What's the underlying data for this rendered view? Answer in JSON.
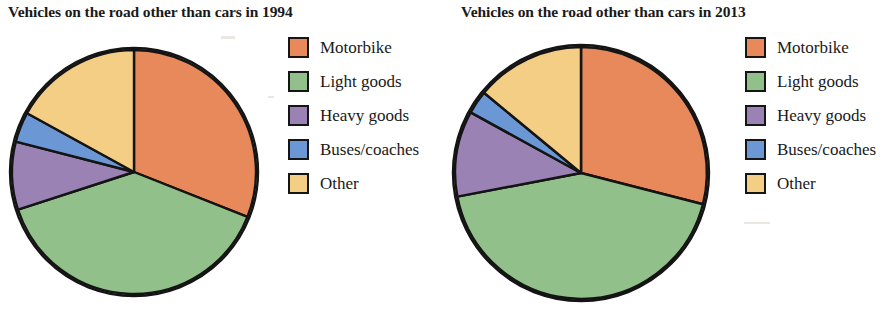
{
  "figure": {
    "background": "#ffffff",
    "panels": [
      {
        "title": "Vehicles on the road other than cars in 1994",
        "legend_title": "",
        "legend": [
          {
            "label": "Motorbike",
            "color": "#E8895C",
            "icon": "legend-swatch-motorbike"
          },
          {
            "label": "Light goods",
            "color": "#92C08A",
            "icon": "legend-swatch-light-goods"
          },
          {
            "label": "Heavy goods",
            "color": "#9B82B4",
            "icon": "legend-swatch-heavy-goods"
          },
          {
            "label": "Buses/coaches",
            "color": "#6B97D4",
            "icon": "legend-swatch-buses-coaches"
          },
          {
            "label": "Other",
            "color": "#F5CE85",
            "icon": "legend-swatch-other"
          }
        ]
      },
      {
        "title": "Vehicles on the road other than cars in 2013",
        "legend_title": "",
        "legend": [
          {
            "label": "Motorbike",
            "color": "#E8895C",
            "icon": "legend-swatch-motorbike"
          },
          {
            "label": "Light goods",
            "color": "#92C08A",
            "icon": "legend-swatch-light-goods"
          },
          {
            "label": "Heavy goods",
            "color": "#9B82B4",
            "icon": "legend-swatch-heavy-goods"
          },
          {
            "label": "Buses/coaches",
            "color": "#6B97D4",
            "icon": "legend-swatch-buses-coaches"
          },
          {
            "label": "Other",
            "color": "#F5CE85",
            "icon": "legend-swatch-other"
          }
        ]
      }
    ]
  },
  "chart_data": [
    {
      "type": "pie",
      "title": "Vehicles on the road other than cars in 1994",
      "xlabel": "",
      "ylabel": "",
      "legend_position": "right",
      "start_angle_deg": 0,
      "direction": "clockwise",
      "labels": [
        "Motorbike",
        "Light goods",
        "Heavy goods",
        "Buses/coaches",
        "Other"
      ],
      "values": [
        31,
        39,
        9,
        4,
        17
      ],
      "units": "percent",
      "colors": [
        "#E8895C",
        "#92C08A",
        "#9B82B4",
        "#6B97D4",
        "#F5CE85"
      ],
      "slice_angles_deg": [
        114,
        141,
        31,
        14,
        60
      ],
      "slices": [
        {
          "label": "Motorbike",
          "value": 31,
          "angle_deg": 114,
          "color": "#E8895C"
        },
        {
          "label": "Light goods",
          "value": 39,
          "angle_deg": 141,
          "color": "#92C08A"
        },
        {
          "label": "Heavy goods",
          "value": 9,
          "angle_deg": 31,
          "color": "#9B82B4"
        },
        {
          "label": "Buses/coaches",
          "value": 4,
          "angle_deg": 14,
          "color": "#6B97D4"
        },
        {
          "label": "Other",
          "value": 17,
          "angle_deg": 60,
          "color": "#F5CE85"
        }
      ]
    },
    {
      "type": "pie",
      "title": "Vehicles on the road other than cars in 2013",
      "xlabel": "",
      "ylabel": "",
      "legend_position": "right",
      "start_angle_deg": 0,
      "direction": "clockwise",
      "labels": [
        "Motorbike",
        "Light goods",
        "Heavy goods",
        "Buses/coaches",
        "Other"
      ],
      "values": [
        29,
        43,
        11,
        3,
        14
      ],
      "units": "percent",
      "colors": [
        "#E8895C",
        "#92C08A",
        "#9B82B4",
        "#6B97D4",
        "#F5CE85"
      ],
      "slice_angles_deg": [
        106,
        155,
        39,
        10,
        50
      ],
      "slices": [
        {
          "label": "Motorbike",
          "value": 29,
          "angle_deg": 106,
          "color": "#E8895C"
        },
        {
          "label": "Light goods",
          "value": 43,
          "angle_deg": 155,
          "color": "#92C08A"
        },
        {
          "label": "Heavy goods",
          "value": 11,
          "angle_deg": 39,
          "color": "#9B82B4"
        },
        {
          "label": "Buses/coaches",
          "value": 3,
          "angle_deg": 10,
          "color": "#6B97D4"
        },
        {
          "label": "Other",
          "value": 14,
          "angle_deg": 50,
          "color": "#F5CE85"
        }
      ]
    }
  ]
}
